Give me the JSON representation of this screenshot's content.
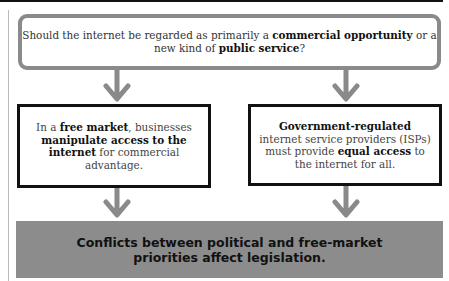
{
  "question": {
    "parts": [
      {
        "text": "Should the internet be regarded as primarily a ",
        "bold": false
      },
      {
        "text": "commercial opportunity",
        "bold": true
      },
      {
        "text": " or a new kind of ",
        "bold": false
      },
      {
        "text": "public service",
        "bold": true
      },
      {
        "text": "?",
        "bold": false
      }
    ]
  },
  "left_box": {
    "parts": [
      {
        "text": "In a ",
        "bold": false
      },
      {
        "text": "free market",
        "bold": true
      },
      {
        "text": ", businesses ",
        "bold": false
      },
      {
        "text": "manipulate access to the internet",
        "bold": true
      },
      {
        "text": " for commercial advantage.",
        "bold": false
      }
    ]
  },
  "right_box": {
    "parts": [
      {
        "text": "Government-regulated",
        "bold": true
      },
      {
        "text": " internet service providers (ISPs) must provide ",
        "bold": false
      },
      {
        "text": "equal access",
        "bold": true
      },
      {
        "text": " to the internet for all.",
        "bold": false
      }
    ]
  },
  "conclusion": {
    "line1": "Conflicts between political and free-market",
    "line2": "priorities affect legislation."
  },
  "colors": {
    "arrow": "#8a8a8a",
    "question_border": "#8a8a8a",
    "box_border": "#111111",
    "bar_fill": "#8c8c8c"
  }
}
